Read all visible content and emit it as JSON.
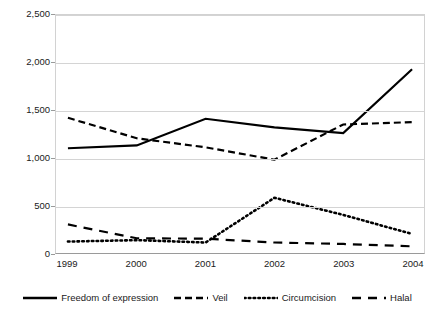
{
  "chart_data": {
    "type": "line",
    "title": "",
    "xlabel": "",
    "ylabel": "",
    "categories": [
      "1999",
      "2000",
      "2001",
      "2002",
      "2003",
      "2004"
    ],
    "ylim": [
      0,
      2500
    ],
    "yticks": [
      "0",
      "500",
      "1,000",
      "1,500",
      "2,000",
      "2,500"
    ],
    "ytick_values": [
      0,
      500,
      1000,
      1500,
      2000,
      2500
    ],
    "grid": true,
    "legend_position": "bottom",
    "series": [
      {
        "name": "Freedom of expression",
        "style": "solid",
        "color": "#000000",
        "values": [
          1100,
          1130,
          1410,
          1320,
          1260,
          1930
        ]
      },
      {
        "name": "Veil",
        "style": "dashed",
        "color": "#000000",
        "values": [
          1420,
          1205,
          1110,
          980,
          1350,
          1375
        ]
      },
      {
        "name": "Circumcision",
        "style": "dotted",
        "color": "#000000",
        "values": [
          120,
          135,
          110,
          580,
          400,
          200
        ]
      },
      {
        "name": "Halal",
        "style": "long-dash",
        "color": "#000000",
        "values": [
          300,
          155,
          150,
          110,
          95,
          70
        ]
      }
    ]
  }
}
